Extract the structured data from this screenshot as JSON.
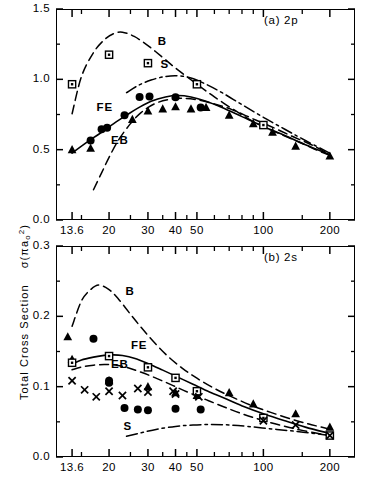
{
  "figure": {
    "y_axis_title_main": "Total Cross Section",
    "y_axis_title_symbol": "σ(πa",
    "y_axis_title_sub": "o",
    "y_axis_title_sup": "2",
    "y_axis_title_close": ")",
    "x_axis_title": "Incident Electron Energy   E(eV)",
    "ink_color": "#000000",
    "background_color": "#ffffff"
  },
  "chart_data": [
    {
      "type": "line",
      "panel_id": "a",
      "title": "(a) 2p",
      "xlabel": "Incident Electron Energy   E(eV)",
      "ylabel": "Total Cross Section σ(πa₀²)",
      "xscale": "log",
      "xlim": [
        11.5,
        260
      ],
      "ylim": [
        0.0,
        1.5
      ],
      "yticks": [
        0.0,
        0.5,
        1.0,
        1.5
      ],
      "ytick_labels": [
        "0.0",
        "0.5",
        "1.0",
        "1.5"
      ],
      "yminor_ticks": [
        0.25,
        0.75,
        1.25
      ],
      "xticks_labeled": [
        13.6,
        20,
        30,
        40,
        50,
        100,
        200
      ],
      "xtick_labels": [
        "13.6",
        "20",
        "30",
        "40",
        "50",
        "100",
        "200"
      ],
      "xticks_minor": [
        15,
        25,
        35,
        45,
        60,
        70,
        80,
        90,
        150
      ],
      "grid": false,
      "legend_position": "inline-annotations",
      "series": [
        {
          "name": "B",
          "label": "B",
          "style": "dashed",
          "kind": "curve",
          "x": [
            13.6,
            15,
            17,
            19,
            21,
            23,
            26,
            30,
            35,
            40,
            50,
            60,
            75,
            90,
            110,
            140,
            170,
            200
          ],
          "y": [
            0.755,
            1.02,
            1.19,
            1.28,
            1.325,
            1.335,
            1.305,
            1.24,
            1.155,
            1.08,
            0.965,
            0.875,
            0.775,
            0.7,
            0.635,
            0.565,
            0.505,
            0.46
          ]
        },
        {
          "name": "S",
          "label": "S",
          "style": "dash-dot",
          "kind": "curve",
          "x": [
            24,
            27,
            31,
            36,
            41,
            47,
            55,
            65,
            80,
            100,
            125,
            155,
            200
          ],
          "y": [
            0.905,
            0.955,
            0.995,
            1.02,
            1.025,
            1.01,
            0.965,
            0.905,
            0.82,
            0.73,
            0.645,
            0.565,
            0.475
          ]
        },
        {
          "name": "FE",
          "label": "FE",
          "style": "solid",
          "kind": "curve",
          "x": [
            13.6,
            15,
            17,
            19,
            21,
            24,
            27,
            31,
            36,
            41,
            47,
            55,
            65,
            80,
            100,
            125,
            155,
            200
          ],
          "y": [
            0.475,
            0.525,
            0.585,
            0.635,
            0.685,
            0.745,
            0.795,
            0.845,
            0.875,
            0.885,
            0.875,
            0.845,
            0.8,
            0.735,
            0.665,
            0.6,
            0.535,
            0.465
          ]
        },
        {
          "name": "EB",
          "label": "EB",
          "style": "dashed",
          "kind": "curve",
          "x": [
            17,
            18.5,
            20,
            22,
            25,
            28,
            32,
            37,
            43,
            50,
            60,
            72,
            88,
            108,
            135,
            165,
            200
          ],
          "y": [
            0.215,
            0.335,
            0.445,
            0.565,
            0.685,
            0.765,
            0.825,
            0.855,
            0.865,
            0.855,
            0.825,
            0.785,
            0.725,
            0.665,
            0.595,
            0.535,
            0.465
          ]
        },
        {
          "name": "filled-circle-data",
          "label": "filled circles",
          "marker": "circle",
          "kind": "points",
          "x": [
            16.5,
            18.5,
            19.6,
            23.5,
            27.5,
            30.5,
            40,
            52
          ],
          "y": [
            0.565,
            0.645,
            0.655,
            0.745,
            0.875,
            0.878,
            0.872,
            0.8
          ]
        },
        {
          "name": "filled-triangle-data",
          "label": "filled triangles",
          "marker": "triangle",
          "kind": "points",
          "x": [
            13.6,
            16.5,
            25.5,
            30,
            35,
            40,
            47,
            55,
            70,
            90,
            110,
            140,
            200
          ],
          "y": [
            0.5,
            0.51,
            0.715,
            0.775,
            0.79,
            0.805,
            0.79,
            0.8,
            0.745,
            0.685,
            0.625,
            0.525,
            0.455
          ]
        },
        {
          "name": "open-square-data",
          "label": "open squares",
          "marker": "square",
          "kind": "points",
          "x": [
            13.6,
            20,
            30,
            50,
            100
          ],
          "y": [
            0.965,
            1.175,
            1.115,
            0.965,
            0.675
          ]
        }
      ]
    },
    {
      "type": "line",
      "panel_id": "b",
      "title": "(b) 2s",
      "xlabel": "Incident Electron Energy   E(eV)",
      "ylabel": "Total Cross Section σ(πa₀²)",
      "xscale": "log",
      "xlim": [
        11.5,
        260
      ],
      "ylim": [
        0.0,
        0.3
      ],
      "yticks": [
        0.0,
        0.1,
        0.2,
        0.3
      ],
      "ytick_labels": [
        "0.0",
        "0.1",
        "0.2",
        "0.3"
      ],
      "yminor_ticks": [
        0.05,
        0.15,
        0.25
      ],
      "xticks_labeled": [
        13.6,
        20,
        30,
        40,
        50,
        100,
        200
      ],
      "xtick_labels": [
        "13.6",
        "20",
        "30",
        "40",
        "50",
        "100",
        "200"
      ],
      "xticks_minor": [
        15,
        25,
        35,
        45,
        60,
        70,
        80,
        90,
        150
      ],
      "grid": false,
      "legend_position": "inline-annotations",
      "series": [
        {
          "name": "B",
          "label": "B",
          "style": "dashed",
          "kind": "curve",
          "x": [
            13.6,
            15,
            16.5,
            18,
            20,
            22,
            25,
            28,
            32,
            37,
            43,
            50,
            60,
            72,
            88,
            108,
            135,
            165,
            200
          ],
          "y": [
            0.186,
            0.222,
            0.238,
            0.2445,
            0.238,
            0.225,
            0.203,
            0.184,
            0.163,
            0.143,
            0.126,
            0.112,
            0.0975,
            0.0855,
            0.0735,
            0.0635,
            0.0535,
            0.046,
            0.0395
          ]
        },
        {
          "name": "S",
          "label": "S",
          "style": "dash-dot",
          "kind": "curve",
          "x": [
            24,
            28,
            33,
            40,
            48,
            58,
            70,
            85,
            105,
            130,
            160,
            200
          ],
          "y": [
            0.0295,
            0.0345,
            0.0395,
            0.0435,
            0.0455,
            0.0462,
            0.0455,
            0.0435,
            0.0405,
            0.0375,
            0.0345,
            0.0305
          ]
        },
        {
          "name": "FE",
          "label": "FE",
          "style": "solid",
          "kind": "curve",
          "x": [
            13.6,
            15,
            17,
            19,
            21,
            23,
            26,
            30,
            35,
            41,
            48,
            57,
            68,
            82,
            100,
            125,
            155,
            200
          ],
          "y": [
            0.132,
            0.138,
            0.142,
            0.1445,
            0.1452,
            0.1442,
            0.1405,
            0.133,
            0.1235,
            0.1135,
            0.1035,
            0.0925,
            0.0825,
            0.0715,
            0.0615,
            0.0515,
            0.0425,
            0.0335
          ]
        },
        {
          "name": "EB",
          "label": "EB",
          "style": "dashed",
          "kind": "curve",
          "x": [
            13.6,
            15,
            17,
            19,
            21,
            24,
            28,
            33,
            39,
            46,
            55,
            66,
            80,
            98,
            122,
            152,
            200
          ],
          "y": [
            0.124,
            0.128,
            0.1305,
            0.1315,
            0.131,
            0.1275,
            0.1205,
            0.1115,
            0.1015,
            0.0915,
            0.0815,
            0.0715,
            0.0615,
            0.0525,
            0.0445,
            0.0375,
            0.0305
          ]
        },
        {
          "name": "filled-circle-data",
          "label": "filled circles",
          "marker": "circle",
          "kind": "points",
          "x": [
            17,
            20,
            20,
            23.5,
            27,
            30,
            40,
            52
          ],
          "y": [
            0.168,
            0.1055,
            0.1085,
            0.0695,
            0.0675,
            0.0665,
            0.0685,
            0.0675
          ]
        },
        {
          "name": "filled-triangle-data",
          "label": "filled triangles",
          "marker": "triangle",
          "kind": "points",
          "x": [
            13.0,
            13.6,
            20,
            30,
            40,
            50,
            70,
            90,
            140,
            200
          ],
          "y": [
            0.171,
            0.139,
            0.1085,
            0.1,
            0.0915,
            0.0875,
            0.0915,
            0.0755,
            0.0615,
            0.0425
          ]
        },
        {
          "name": "open-square-data",
          "label": "open squares",
          "marker": "square",
          "kind": "points",
          "x": [
            13.6,
            20,
            30,
            40,
            50,
            100,
            200
          ],
          "y": [
            0.134,
            0.1435,
            0.1275,
            0.1125,
            0.0935,
            0.0555,
            0.0305
          ]
        },
        {
          "name": "cross-data",
          "label": "crosses",
          "marker": "cross",
          "kind": "points",
          "x": [
            13.6,
            15.5,
            17.5,
            20,
            23,
            27,
            30,
            39,
            40,
            51,
            100,
            140,
            200
          ],
          "y": [
            0.1085,
            0.0955,
            0.0855,
            0.0935,
            0.0875,
            0.0975,
            0.0925,
            0.0935,
            0.0895,
            0.0855,
            0.0515,
            0.0455,
            0.0305
          ]
        }
      ],
      "annotations": [
        {
          "text": "B",
          "x": 25,
          "y": 0.222
        },
        {
          "text": "S",
          "x": 24.5,
          "y": 0.0295
        },
        {
          "text": "FE",
          "x": 26.5,
          "y": 0.1445
        },
        {
          "text": "EB",
          "x": 21.5,
          "y": 0.1175
        }
      ]
    }
  ],
  "panel_a_annotations": [
    {
      "text": "B",
      "x": 35,
      "y": 1.2
    },
    {
      "text": "S",
      "x": 36,
      "y": 1.04
    },
    {
      "text": "FE",
      "x": 18.5,
      "y": 0.73
    },
    {
      "text": "EB",
      "x": 21.5,
      "y": 0.5
    }
  ]
}
